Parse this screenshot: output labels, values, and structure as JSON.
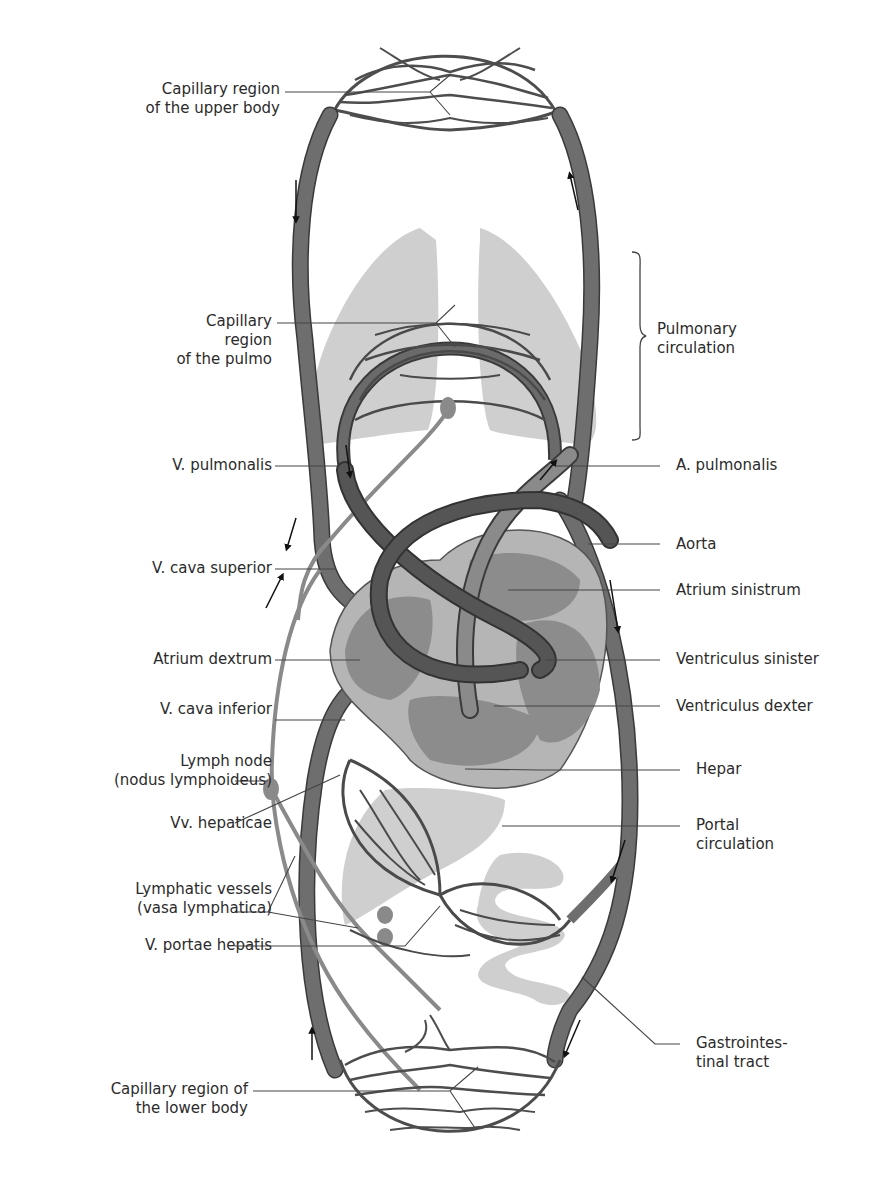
{
  "colors": {
    "vessel": "#6e6e6e",
    "vessel_dark": "#4a4a4a",
    "vessel_outline": "#3a3a3a",
    "organ": "#c9c9c9",
    "heart_wall": "#b5b5b5",
    "heart_inner": "#8c8c8c",
    "lymph": "#8a8a8a",
    "leader": "#444444",
    "text": "#2b2b2b"
  },
  "labels": {
    "capillary_upper": [
      "Capillary region",
      "of the upper body"
    ],
    "capillary_pulmo": [
      "Capillary",
      "region",
      "of the pulmo"
    ],
    "pulmonary_circulation": [
      "Pulmonary",
      "circulation"
    ],
    "v_pulmonalis": "V. pulmonalis",
    "a_pulmonalis": "A. pulmonalis",
    "v_cava_superior": "V. cava superior",
    "aorta": "Aorta",
    "atrium_sinistrum": "Atrium sinistrum",
    "atrium_dextrum": "Atrium dextrum",
    "ventriculus_sinister": "Ventriculus sinister",
    "v_cava_inferior": "V. cava inferior",
    "ventriculus_dexter": "Ventriculus dexter",
    "lymph_node": [
      "Lymph node",
      "(nodus lymphoideus)"
    ],
    "hepar": "Hepar",
    "vv_hepaticae": "Vv. hepaticae",
    "portal_circulation": [
      "Portal",
      "circulation"
    ],
    "lymphatic_vessels": [
      "Lymphatic vessels",
      "(vasa lymphatica)"
    ],
    "v_portae_hepatis": "V. portae hepatis",
    "gastrointestinal_tract": [
      "Gastrointes-",
      "tinal tract"
    ],
    "capillary_lower": [
      "Capillary region of",
      "the lower body"
    ]
  }
}
